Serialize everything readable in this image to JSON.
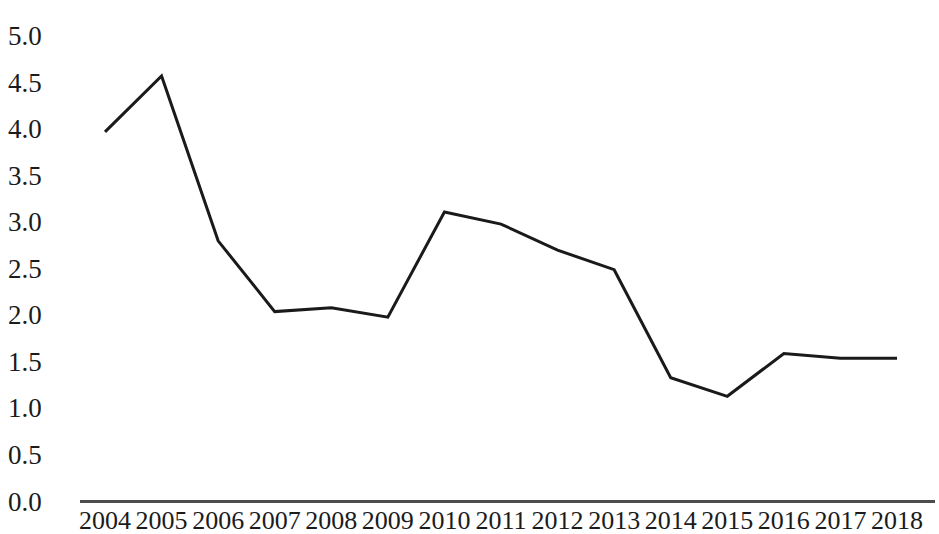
{
  "chart_data": {
    "type": "line",
    "title": "",
    "subtitle": "",
    "xlabel": "",
    "ylabel": "",
    "categories": [
      "2004",
      "2005",
      "2006",
      "2007",
      "2008",
      "2009",
      "2010",
      "2011",
      "2012",
      "2013",
      "2014",
      "2015",
      "2016",
      "2017",
      "2018"
    ],
    "series": [
      {
        "name": "",
        "values": [
          3.97,
          4.57,
          2.8,
          2.04,
          2.08,
          1.98,
          3.11,
          2.98,
          2.7,
          2.49,
          1.33,
          1.13,
          1.59,
          1.54,
          1.54
        ]
      }
    ],
    "ylim": [
      0.0,
      5.0
    ],
    "ytick_labels": [
      "0.0",
      "0.5",
      "1.0",
      "1.5",
      "2.0",
      "2.5",
      "3.0",
      "3.5",
      "4.0",
      "4.5",
      "5.0"
    ],
    "ytick_values": [
      0.0,
      0.5,
      1.0,
      1.5,
      2.0,
      2.5,
      3.0,
      3.5,
      4.0,
      4.5,
      5.0
    ],
    "grid": false,
    "legend": false,
    "legend_position": "none",
    "line_color": "#1a1a1a",
    "line_width": 3,
    "axis_color": "#4d4d4d",
    "background_color": "#ffffff",
    "markers": false,
    "annotations": []
  }
}
